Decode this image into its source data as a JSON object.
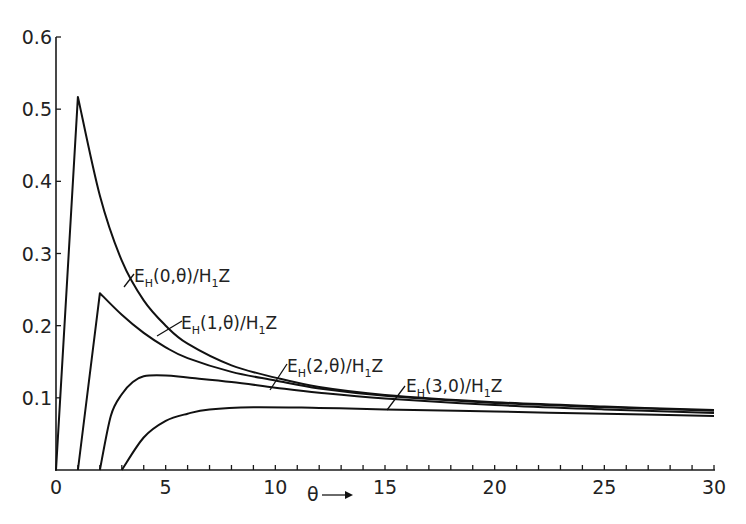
{
  "chart_data": {
    "type": "line",
    "title": "",
    "xlabel": "θ",
    "ylabel": "",
    "xlim": [
      0,
      30
    ],
    "ylim": [
      0,
      0.6
    ],
    "grid": false,
    "x_ticks_major": [
      0,
      5,
      10,
      15,
      20,
      25,
      30
    ],
    "x_ticks_minor_step": 1,
    "y_ticks": [
      0.1,
      0.2,
      0.3,
      0.4,
      0.5,
      0.6
    ],
    "x_tick_labels": [
      "0",
      "5",
      "10",
      "15",
      "20",
      "25",
      "30"
    ],
    "y_tick_labels": [
      "0.1",
      "0.2",
      "0.3",
      "0.4",
      "0.5",
      "0.6"
    ],
    "series": [
      {
        "name": "E_H(0,θ)/H_1Z",
        "label_main": "E",
        "label_sub": "H",
        "label_mid": "(0,θ)/H",
        "label_sub2": "1",
        "label_end": "Z",
        "x": [
          0,
          1,
          2,
          3,
          4,
          5,
          6,
          8,
          10,
          12,
          15,
          20,
          25,
          30
        ],
        "values": [
          0,
          0.517,
          0.38,
          0.29,
          0.235,
          0.2,
          0.175,
          0.145,
          0.128,
          0.115,
          0.104,
          0.094,
          0.088,
          0.083
        ]
      },
      {
        "name": "E_H(1,θ)/H_1Z",
        "label_main": "E",
        "label_sub": "H",
        "label_mid": "(1,θ)/H",
        "label_sub2": "1",
        "label_end": "Z",
        "x": [
          1,
          2,
          3,
          4,
          5,
          6,
          8,
          10,
          12,
          15,
          20,
          25,
          30
        ],
        "values": [
          0,
          0.245,
          0.215,
          0.19,
          0.17,
          0.155,
          0.136,
          0.124,
          0.113,
          0.103,
          0.093,
          0.087,
          0.082
        ]
      },
      {
        "name": "E_H(2,θ)/H_1Z",
        "label_main": "E",
        "label_sub": "H",
        "label_mid": "(2,θ)/H",
        "label_sub2": "1",
        "label_end": "Z",
        "x": [
          2,
          2.5,
          3,
          3.5,
          4,
          5,
          6,
          8,
          10,
          12,
          15,
          20,
          25,
          30
        ],
        "values": [
          0,
          0.075,
          0.105,
          0.122,
          0.13,
          0.131,
          0.128,
          0.122,
          0.114,
          0.107,
          0.099,
          0.09,
          0.084,
          0.079
        ]
      },
      {
        "name": "E_H(3,0)/H_1Z",
        "label_main": "E",
        "label_sub": "H",
        "label_mid": "(3,0)/H",
        "label_sub2": "1",
        "label_end": "Z",
        "x": [
          3,
          4,
          5,
          6,
          7,
          9,
          12,
          15,
          20,
          25,
          30
        ],
        "values": [
          0,
          0.045,
          0.068,
          0.078,
          0.084,
          0.087,
          0.086,
          0.084,
          0.081,
          0.078,
          0.075
        ]
      }
    ],
    "annotations": [
      "θ →"
    ]
  }
}
